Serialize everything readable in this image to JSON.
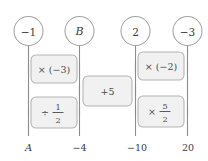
{
  "diagram": {
    "type": "function-machine-flowchart",
    "colors": {
      "background": "#ffffff",
      "box_fill": "#f1f1f1",
      "box_stroke": "#b4b4b4",
      "circle_fill": "#ffffff",
      "circle_stroke": "#a2a2a2",
      "rail_stroke": "#8c8c8c",
      "text": "#3a3a3a"
    },
    "nodes": [
      {
        "id": "node-1",
        "label": "−1",
        "italic": false
      },
      {
        "id": "node-2",
        "label": "B",
        "italic": true
      },
      {
        "id": "node-3",
        "label": "2",
        "italic": false
      },
      {
        "id": "node-4",
        "label": "−3",
        "italic": false
      }
    ],
    "operations": [
      {
        "id": "op-multiply-neg3",
        "label": "× (−3)",
        "kind": "plain",
        "between": [
          "node-1",
          "node-2"
        ]
      },
      {
        "id": "op-divide-half",
        "label": "÷",
        "kind": "fraction",
        "numerator": "1",
        "denominator": "2",
        "between": [
          "node-1",
          "node-2"
        ]
      },
      {
        "id": "op-plus-5",
        "label": "+5",
        "kind": "plain",
        "between": [
          "node-2",
          "node-3"
        ]
      },
      {
        "id": "op-multiply-neg2",
        "label": "× (−2)",
        "kind": "plain",
        "between": [
          "node-3",
          "node-4"
        ]
      },
      {
        "id": "op-multiply-five-halves",
        "label": "×",
        "kind": "fraction",
        "numerator": "5",
        "denominator": "2",
        "between": [
          "node-3",
          "node-4"
        ]
      }
    ],
    "axis_labels": [
      {
        "id": "axis-label-a",
        "label": "A",
        "italic": true
      },
      {
        "id": "axis-label-neg4",
        "label": "−4",
        "italic": false
      },
      {
        "id": "axis-label-neg10",
        "label": "−10",
        "italic": false
      },
      {
        "id": "axis-label-20",
        "label": "20",
        "italic": false
      }
    ]
  }
}
